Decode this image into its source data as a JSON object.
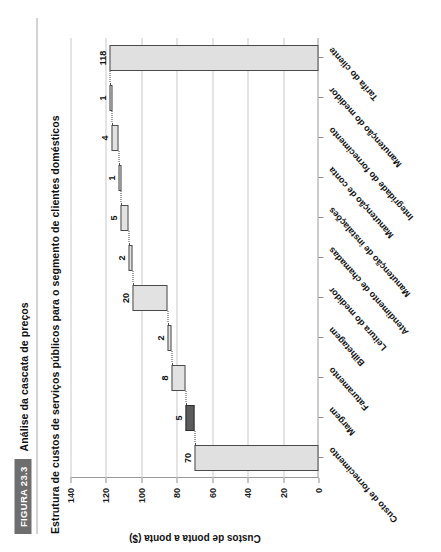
{
  "header": {
    "badge": "FIGURA 23.3",
    "title": "Análise da cascata de preços"
  },
  "chart_data": {
    "type": "bar",
    "subtype": "waterfall",
    "title": "Estrutura de custos de serviços públicos para o segmento de clientes domésticos",
    "xlabel": "",
    "ylabel": "Custos de ponta a ponta ($)",
    "ylim": [
      0,
      140
    ],
    "yticks": [
      140,
      120,
      100,
      80,
      60,
      40,
      20,
      0
    ],
    "grid": true,
    "legend": null,
    "categories": [
      "Custo de fornecimento",
      "Margem",
      "Faturamento",
      "Bilhetagem",
      "Leitura do medidor",
      "Atendimento de chamadas",
      "Manutenção de instalações",
      "Manutenção de conta",
      "Integridade do fornecimento",
      "Manutenção do medidor",
      "Tarifa do cliente"
    ],
    "values": [
      70,
      5,
      8,
      2,
      20,
      2,
      5,
      1,
      4,
      1,
      118
    ],
    "labels": [
      "70",
      "5",
      "8",
      "2",
      "20",
      "2",
      "5",
      "1",
      "4",
      "1",
      "118"
    ],
    "kinds": [
      "total",
      "neg",
      "delta",
      "delta",
      "delta",
      "delta",
      "delta",
      "delta",
      "delta",
      "delta",
      "total"
    ],
    "bases": [
      0,
      70,
      75,
      83,
      85,
      105,
      107,
      112,
      113,
      117,
      0
    ],
    "tops": [
      70,
      75,
      83,
      85,
      105,
      107,
      112,
      113,
      117,
      118,
      118
    ]
  },
  "colors": {
    "badge_bg": "#6e6e6e",
    "bar_fill": "#e0e0e0",
    "bar_edge": "#4a4a4a",
    "bar_fill_dark": "#5b5b5b",
    "grid": "#c9c9c9",
    "axis": "#9a9a9a",
    "text": "#111111"
  }
}
